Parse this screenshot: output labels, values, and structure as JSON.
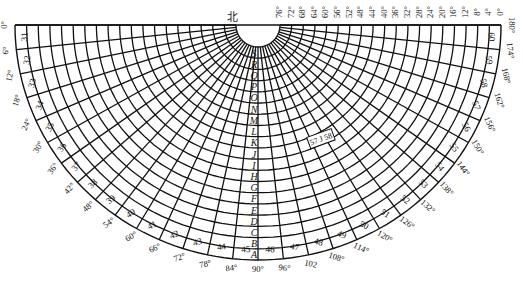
{
  "diagram": {
    "north_label": "北",
    "center_label": "57 J 58",
    "ring_letters": [
      "S",
      "R",
      "Q",
      "P",
      "O",
      "N",
      "M",
      "L",
      "K",
      "J",
      "I",
      "H",
      "G",
      "F",
      "E",
      "D",
      "C",
      "B",
      "A"
    ],
    "zone_numbers": [
      31,
      32,
      33,
      34,
      35,
      36,
      37,
      38,
      39,
      40,
      41,
      42,
      43,
      44,
      45,
      46,
      47,
      48,
      49,
      50,
      51,
      52,
      53,
      54,
      55,
      56,
      57,
      58,
      59,
      60
    ],
    "longitude_labels": [
      "0°",
      "6°",
      "12°",
      "18°",
      "24°",
      "30°",
      "36°",
      "42°",
      "48°",
      "54°",
      "60°",
      "66°",
      "72°",
      "78°",
      "84°",
      "90°",
      "96°",
      "102",
      "108°",
      "114°",
      "120°",
      "126°",
      "132°",
      "138°",
      "144°",
      "150°",
      "156°",
      "162°",
      "168°",
      "174°",
      "180°"
    ],
    "latitude_labels": [
      "76°",
      "72°",
      "68°",
      "64°",
      "60°",
      "56°",
      "52°",
      "48°",
      "44°",
      "40°",
      "36°",
      "32°",
      "28°",
      "24°",
      "20°",
      "16°",
      "12°",
      "8°",
      "4°",
      "0°"
    ],
    "colors": {
      "ink": "#111111",
      "paper": "#ffffff"
    }
  }
}
